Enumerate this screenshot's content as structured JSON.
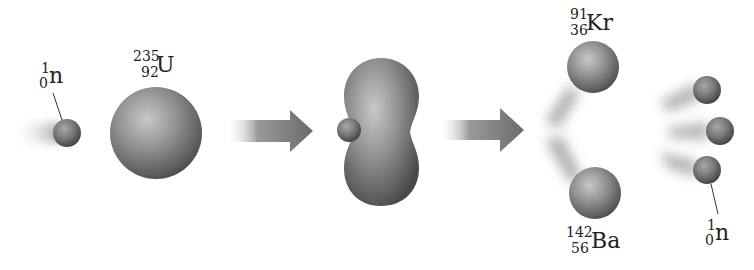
{
  "diagram": {
    "stages": [
      {
        "id": "reactants",
        "description": "Neutron approaching uranium-235 nucleus"
      },
      {
        "id": "intermediate",
        "description": "Unstable nucleus deforming after neutron capture"
      },
      {
        "id": "products",
        "description": "Fission products krypton-91, barium-142 and three neutrons"
      }
    ],
    "labels": {
      "neutron_in": {
        "mass": "1",
        "atomic": "0",
        "symbol": "n"
      },
      "uranium": {
        "mass": "235",
        "atomic": "92",
        "symbol": "U"
      },
      "krypton": {
        "mass": "91",
        "atomic": "36",
        "symbol": "Kr"
      },
      "barium": {
        "mass": "142",
        "atomic": "56",
        "symbol": "Ba"
      },
      "neutron_out": {
        "mass": "1",
        "atomic": "0",
        "symbol": "n"
      }
    },
    "arrows": [
      {
        "id": "arrow-1",
        "meaning": "reaction step"
      },
      {
        "id": "arrow-2",
        "meaning": "reaction step"
      }
    ],
    "colors": {
      "sphere_highlight": "#c4c4c4",
      "sphere_mid": "#8a8a8a",
      "sphere_edge": "#4a4a4a",
      "arrow": "#6e6e6e",
      "text": "#222222",
      "background": "#ffffff"
    }
  }
}
